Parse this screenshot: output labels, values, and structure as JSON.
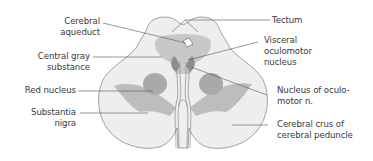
{
  "diagram": {
    "colors": {
      "outline": "#8a8a8a",
      "tissue_light": "#eeeeee",
      "gray_substance": "#c8c8c8",
      "red_nucleus": "#a9a9a9",
      "substantia_nigra": "#bdbdbd",
      "nucleus_dark": "#8f8f8f",
      "aqueduct": "#ffffff",
      "leader_line": "#555555",
      "text": "#3a3a3a"
    },
    "labels_left": [
      {
        "id": "cerebral-aqueduct",
        "text": "Cerebral\naqueduct"
      },
      {
        "id": "central-gray-substance",
        "text": "Central gray\nsubstance"
      },
      {
        "id": "red-nucleus",
        "text": "Red nucleus"
      },
      {
        "id": "substantia-nigra",
        "text": "Substantia\nnigra"
      }
    ],
    "labels_right": [
      {
        "id": "tectum",
        "text": "Tectum"
      },
      {
        "id": "visceral-oculomotor-nucleus",
        "text": "Visceral\noculomotor\nnucleus"
      },
      {
        "id": "nucleus-of-oculomotor-n",
        "text": "Nucleus of oculo-\nmotor n."
      },
      {
        "id": "cerebral-crus",
        "text": "Cerebral crus of\ncerebral peduncle"
      }
    ]
  }
}
